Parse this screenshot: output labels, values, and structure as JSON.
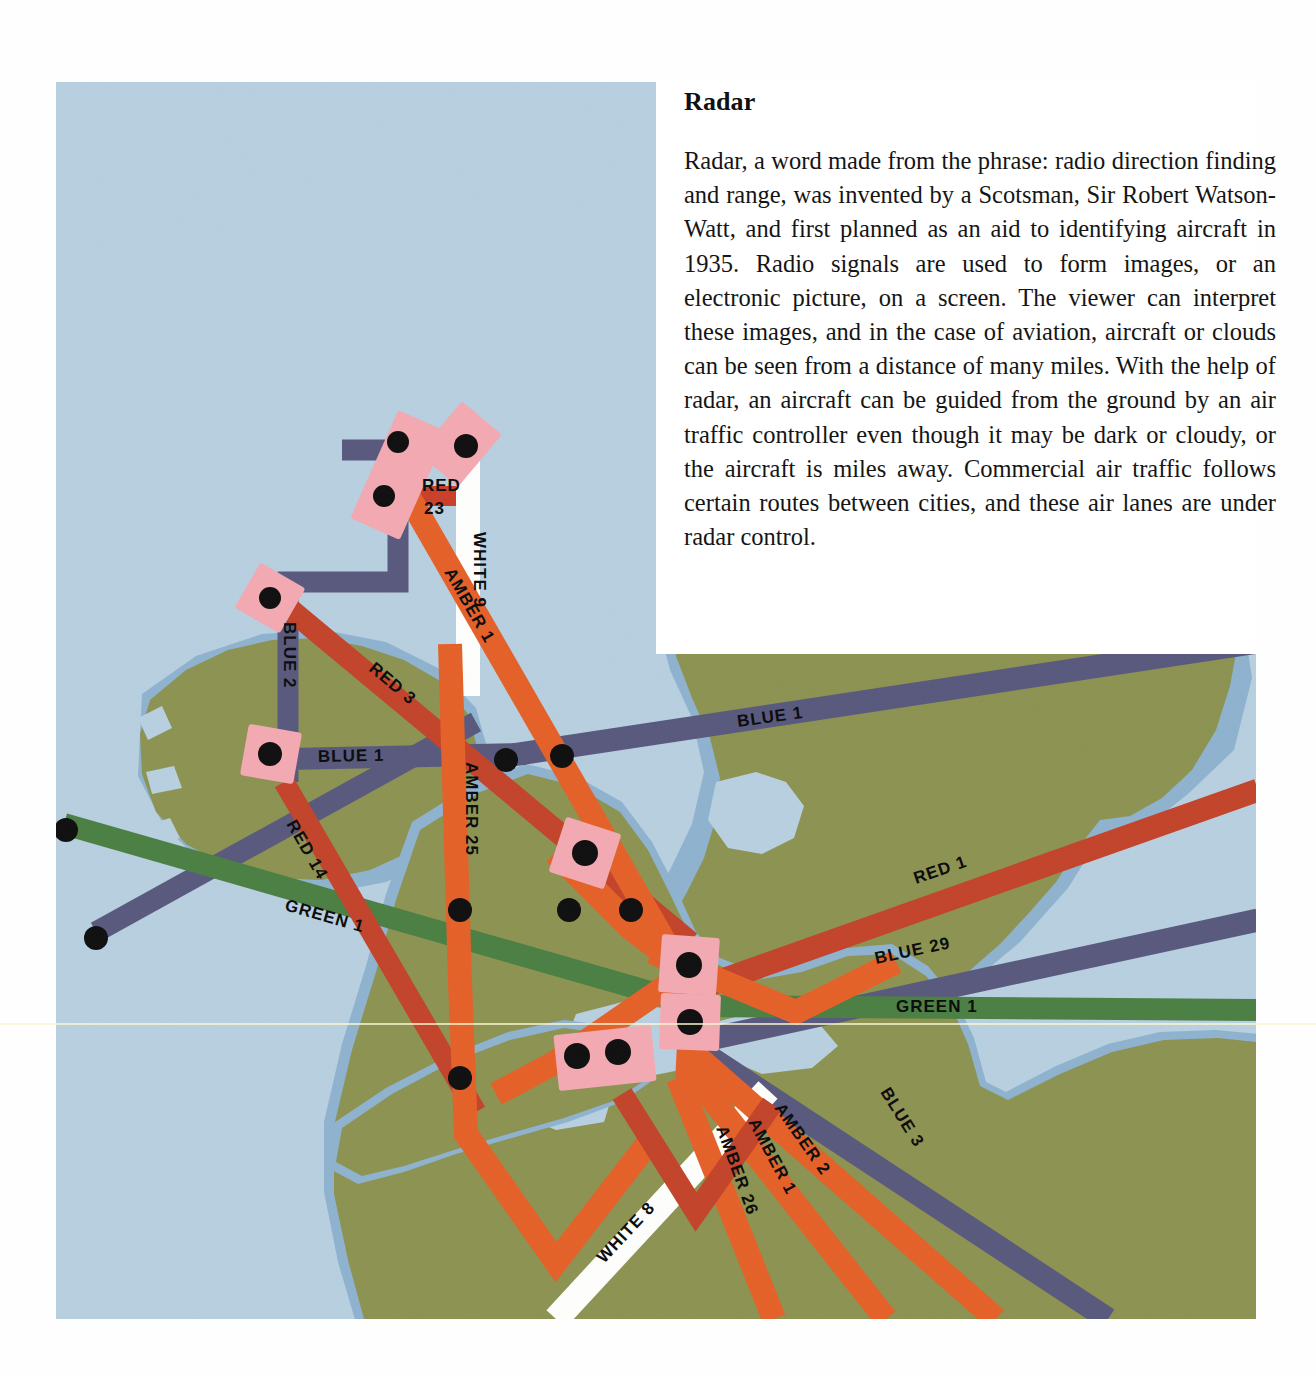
{
  "article": {
    "title": "Radar",
    "body": "Radar, a word made from the phrase: radio direction finding and range, was invented by a Scotsman, Sir Robert Watson-Watt, and first planned as an aid to identifying aircraft in 1935. Radio signals are used to form images, or an electronic picture, on a screen. The viewer can interpret these images, and in the case of aviation, aircraft or clouds can be seen from a distance of many miles. With the help of radar, an aircraft can be guided from the ground by an air traffic controller even though it may be dark or cloudy, or the aircraft is miles away. Commercial air traffic follows certain routes between cities, and these air lanes are under radar control."
  },
  "map": {
    "caption_colors": {
      "sea": "#b6cfe0",
      "sea_shelf": "#8fb0cf",
      "land": "#8a9150",
      "land_shadow": "#9aa055",
      "amber": "#e4622a",
      "red": "#c9412a",
      "blue": "#5a5a7e",
      "green": "#4c8044",
      "white": "#fdfdfb",
      "waypoint_marker": "#f2a9b2",
      "waypoint_dot": "#111111"
    },
    "airways": [
      {
        "id": "red-23",
        "label": "RED 23",
        "color_name": "red",
        "color": "#c9412a"
      },
      {
        "id": "white-9",
        "label": "WHITE 9",
        "color_name": "white",
        "color": "#fdfdfb"
      },
      {
        "id": "amber-1-n",
        "label": "AMBER 1",
        "color_name": "amber",
        "color": "#e4622a"
      },
      {
        "id": "blue-2",
        "label": "BLUE 2",
        "color_name": "blue",
        "color": "#5a5a7e"
      },
      {
        "id": "red-3",
        "label": "RED 3",
        "color_name": "red",
        "color": "#c9412a"
      },
      {
        "id": "blue-1-w",
        "label": "BLUE 1",
        "color_name": "blue",
        "color": "#5a5a7e"
      },
      {
        "id": "blue-1-e",
        "label": "BLUE 1",
        "color_name": "blue",
        "color": "#5a5a7e"
      },
      {
        "id": "red-14",
        "label": "RED 14",
        "color_name": "red",
        "color": "#c9412a"
      },
      {
        "id": "green-1-w",
        "label": "GREEN 1",
        "color_name": "green",
        "color": "#4c8044"
      },
      {
        "id": "green-1-e",
        "label": "GREEN 1",
        "color_name": "green",
        "color": "#4c8044"
      },
      {
        "id": "amber-25",
        "label": "AMBER 25",
        "color_name": "amber",
        "color": "#e4622a"
      },
      {
        "id": "red-1",
        "label": "RED 1",
        "color_name": "red",
        "color": "#c9412a"
      },
      {
        "id": "blue-29",
        "label": "BLUE 29",
        "color_name": "blue",
        "color": "#5a5a7e"
      },
      {
        "id": "blue-3",
        "label": "BLUE 3",
        "color_name": "blue",
        "color": "#5a5a7e"
      },
      {
        "id": "amber-2",
        "label": "AMBER 2",
        "color_name": "amber",
        "color": "#e4622a"
      },
      {
        "id": "amber-1-s",
        "label": "AMBER 1",
        "color_name": "amber",
        "color": "#e4622a"
      },
      {
        "id": "amber-26",
        "label": "AMBER 26",
        "color_name": "amber",
        "color": "#e4622a"
      },
      {
        "id": "white-8",
        "label": "WHITE 8",
        "color_name": "white",
        "color": "#fdfdfb"
      }
    ],
    "labels": {
      "red_23_line1": "RED",
      "red_23_line2": "23",
      "white_9": "WHITE 9",
      "amber_1_north": "AMBER 1",
      "blue_2": "BLUE 2",
      "red_3": "RED 3",
      "blue_1_west": "BLUE 1",
      "blue_1_east": "BLUE 1",
      "red_14": "RED 14",
      "green_1_west": "GREEN 1",
      "green_1_east": "GREEN 1",
      "amber_25": "AMBER 25",
      "red_1": "RED 1",
      "blue_29": "BLUE 29",
      "blue_3": "BLUE 3",
      "amber_2": "AMBER 2",
      "amber_1_south": "AMBER 1",
      "amber_26": "AMBER 26",
      "white_8": "WHITE 8"
    },
    "waypoint_count": 22
  }
}
